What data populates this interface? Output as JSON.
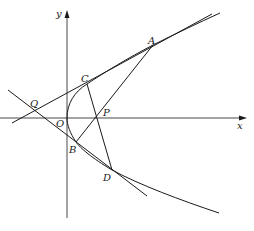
{
  "figure": {
    "axes": {
      "x_label": "x",
      "y_label": "y",
      "origin_label": "O"
    },
    "points": {
      "A": "A",
      "B": "B",
      "C": "C",
      "D": "D",
      "P": "P",
      "Q": "Q"
    },
    "segments": [
      "AB",
      "CD",
      "QA (through C)",
      "QD (through B)"
    ],
    "curve": "parabola y^2 = 2px",
    "colors": {
      "ink": "#1a1a1a",
      "background": "#ffffff"
    }
  }
}
